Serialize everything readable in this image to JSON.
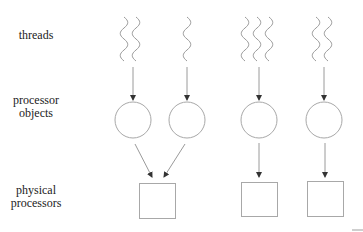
{
  "labels": {
    "threads": "threads",
    "processor_objects_line1": "processor",
    "processor_objects_line2": "objects",
    "physical_processors_line1": "physical",
    "physical_processors_line2": "processors"
  },
  "colors": {
    "stroke": "#9a9a9a",
    "arrowhead": "#333333",
    "text": "#222222",
    "background": "#ffffff"
  },
  "diagram": {
    "thread_groups": [
      {
        "id": "group-1",
        "thread_count": 2,
        "target_processor_object": 1
      },
      {
        "id": "group-2",
        "thread_count": 1,
        "target_processor_object": 2
      },
      {
        "id": "group-3",
        "thread_count": 3,
        "target_processor_object": 3
      },
      {
        "id": "group-4",
        "thread_count": 2,
        "target_processor_object": 4
      }
    ],
    "processor_objects": [
      {
        "id": 1,
        "target_physical_processor": 1
      },
      {
        "id": 2,
        "target_physical_processor": 1
      },
      {
        "id": 3,
        "target_physical_processor": 2
      },
      {
        "id": 4,
        "target_physical_processor": 3
      }
    ],
    "physical_processors": [
      {
        "id": 1
      },
      {
        "id": 2
      },
      {
        "id": 3
      }
    ]
  }
}
